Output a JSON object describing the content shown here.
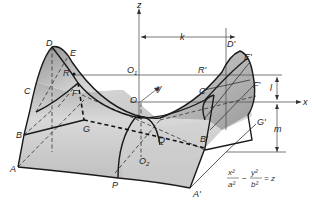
{
  "figure": {
    "equation": {
      "term1_num": "x²",
      "term1_den": "a²",
      "operator": "−",
      "term2_num": "y²",
      "term2_den": "b²",
      "rhs": "= z"
    },
    "axes": {
      "x": "x",
      "y": "y",
      "z": "z"
    },
    "dimensions": {
      "k": "k",
      "l": "l",
      "m": "m"
    },
    "points": {
      "A": "A",
      "B": "B",
      "C": "C",
      "D": "D",
      "E": "E",
      "F": "F",
      "G": "G",
      "R": "R",
      "P": "P",
      "Q": "Q",
      "O": "O",
      "O1": "O",
      "O1_sub": "1",
      "O2": "O",
      "O2_sub": "2",
      "A_prime": "A'",
      "B_prime": "B'",
      "C_prime": "C'",
      "D_prime": "D'",
      "E_prime": "E'",
      "F_prime": "F'",
      "G_prime": "G'",
      "R_prime": "R'"
    },
    "colors": {
      "surface_light": "#e8e8e8",
      "surface_dark": "#9a9a9a",
      "line": "#1a1a1a"
    }
  }
}
